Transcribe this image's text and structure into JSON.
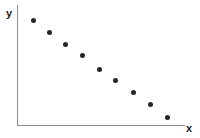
{
  "figure": {
    "width": 200,
    "height": 138,
    "background_color": "#ffffff"
  },
  "axes": {
    "y_axis_label": "y",
    "x_axis_label": "x",
    "axis_color": "#8c8c8c",
    "label_color": "#1a1a1a"
  },
  "markers": {
    "color": "#262626",
    "shape": "circle",
    "size_px": 5
  },
  "chart_data": {
    "type": "scatter",
    "title": "",
    "subtitle": "",
    "xlabel": "x",
    "ylabel": "y",
    "grid": false,
    "legend": null,
    "xlim": [
      0,
      10
    ],
    "ylim": [
      0,
      10
    ],
    "xticks": [],
    "yticks": [],
    "annotations": [],
    "relationship": "negative linear correlation",
    "series": [
      {
        "name": "data",
        "marker": "filled circle",
        "color": "#262626",
        "x": [
          1,
          2,
          3,
          4,
          5,
          6,
          7,
          8,
          9
        ],
        "y": [
          8.8,
          7.7,
          6.8,
          5.9,
          4.7,
          3.8,
          2.8,
          1.8,
          0.7
        ],
        "pixel_points": [
          {
            "px": 33,
            "py": 20
          },
          {
            "px": 49,
            "py": 32
          },
          {
            "px": 65,
            "py": 44
          },
          {
            "px": 82,
            "py": 55
          },
          {
            "px": 99,
            "py": 69
          },
          {
            "px": 115,
            "py": 80
          },
          {
            "px": 133,
            "py": 92
          },
          {
            "px": 150,
            "py": 104
          },
          {
            "px": 167,
            "py": 117
          }
        ]
      }
    ]
  }
}
